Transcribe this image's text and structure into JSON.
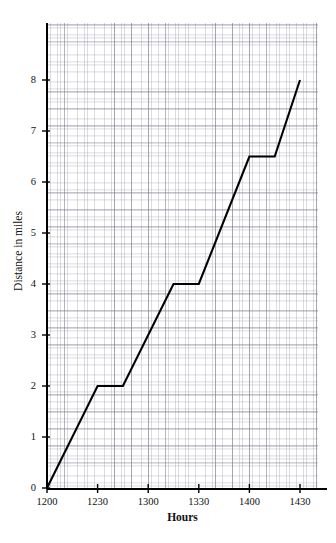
{
  "chart_data": {
    "type": "line",
    "title": "",
    "xlabel": "Hours",
    "ylabel": "Distance in miles",
    "xlim": [
      1200,
      1445
    ],
    "ylim": [
      0,
      9.2
    ],
    "grid": true,
    "grid_style": "graph-paper",
    "legend": "none",
    "line_color": "#000000",
    "x_tick_labels": [
      "1200",
      "1230",
      "1300",
      "1330",
      "1400",
      "1430"
    ],
    "x_tick_values": [
      1200,
      1230,
      1300,
      1330,
      1400,
      1430
    ],
    "y_tick_labels": [
      "0",
      "1",
      "2",
      "3",
      "4",
      "5",
      "6",
      "7",
      "8"
    ],
    "y_tick_values": [
      0,
      1,
      2,
      3,
      4,
      5,
      6,
      7,
      8
    ],
    "series": [
      {
        "name": "distance",
        "x": [
          1200,
          1230,
          1245,
          1315,
          1330,
          1400,
          1415,
          1430
        ],
        "y": [
          0,
          2,
          2,
          4,
          4,
          6.5,
          6.5,
          8
        ]
      }
    ],
    "points": [
      {
        "time": "1200",
        "miles": 0
      },
      {
        "time": "1230",
        "miles": 2
      },
      {
        "time": "1245",
        "miles": 2
      },
      {
        "time": "1315",
        "miles": 4
      },
      {
        "time": "1330",
        "miles": 4
      },
      {
        "time": "1400",
        "miles": 6.5
      },
      {
        "time": "1415",
        "miles": 6.5
      },
      {
        "time": "1430",
        "miles": 8
      }
    ]
  },
  "axes": {
    "x": {
      "title": "Hours",
      "ticks": [
        {
          "label": "1200"
        },
        {
          "label": "1230"
        },
        {
          "label": "1300"
        },
        {
          "label": "1330"
        },
        {
          "label": "1400"
        },
        {
          "label": "1430"
        }
      ]
    },
    "y": {
      "title": "Distance in miles",
      "ticks": [
        {
          "label": "8"
        },
        {
          "label": "7"
        },
        {
          "label": "6"
        },
        {
          "label": "5"
        },
        {
          "label": "4"
        },
        {
          "label": "3"
        },
        {
          "label": "2"
        },
        {
          "label": "1"
        },
        {
          "label": "0"
        }
      ]
    }
  }
}
